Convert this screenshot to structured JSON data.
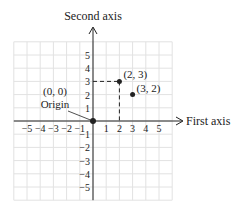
{
  "diagram": {
    "x_axis_label": "First axis",
    "y_axis_label": "Second axis",
    "x_ticks": [
      "−5",
      "−4",
      "−3",
      "−2",
      "−1",
      "1",
      "2",
      "3",
      "4",
      "5"
    ],
    "y_ticks": [
      "5",
      "4",
      "3",
      "2",
      "1",
      "−1",
      "−2",
      "−3",
      "−4",
      "−5"
    ],
    "origin": {
      "label_coords": "(0, 0)",
      "label_name": "Origin"
    },
    "points": [
      {
        "label": "(2, 3)",
        "x": 2,
        "y": 3,
        "dashed_projection": true
      },
      {
        "label": "(3, 2)",
        "x": 3,
        "y": 2,
        "dashed_projection": false
      }
    ],
    "grid_range": [
      -6,
      6
    ],
    "colors": {
      "grid": "#e2e2e2",
      "axis": "#222222",
      "text": "#222222"
    }
  }
}
